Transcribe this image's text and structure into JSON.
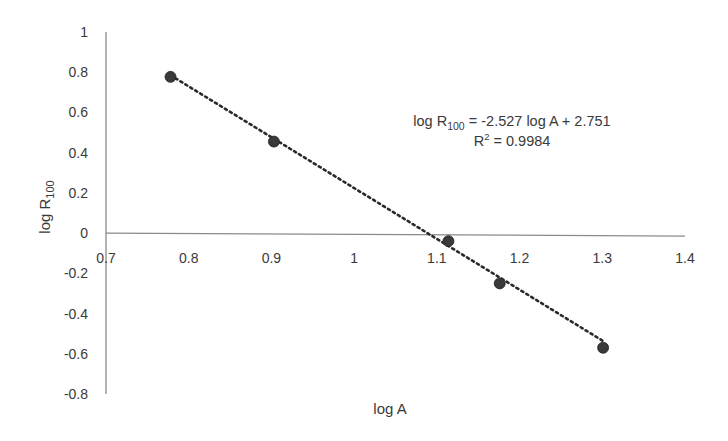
{
  "chart_data": {
    "type": "scatter",
    "title": "",
    "xlabel": "log A",
    "ylabel": "log R100",
    "ylabel_main": "log R",
    "ylabel_sub": "100",
    "xlim": [
      0.7,
      1.4
    ],
    "ylim": [
      -0.8,
      1.0
    ],
    "x_ticks": [
      "0.7",
      "0.8",
      "0.9",
      "1",
      "1.1",
      "1.2",
      "1.3",
      "1.4"
    ],
    "y_ticks": [
      "1",
      "0.8",
      "0.6",
      "0.4",
      "0.2",
      "0",
      "-0.2",
      "-0.4",
      "-0.6",
      "-0.8"
    ],
    "grid": false,
    "legend": null,
    "series": [
      {
        "name": "data",
        "marker": "circle",
        "color": "#3a3a3a",
        "points": [
          {
            "x": 0.778,
            "y": 0.777
          },
          {
            "x": 0.903,
            "y": 0.455
          },
          {
            "x": 1.114,
            "y": -0.04
          },
          {
            "x": 1.176,
            "y": -0.25
          },
          {
            "x": 1.301,
            "y": -0.57
          }
        ]
      }
    ],
    "trendline": {
      "type": "linear",
      "style": "dotted",
      "slope": -2.527,
      "intercept": 2.751,
      "x_range": [
        0.778,
        1.301
      ]
    },
    "annotations": {
      "equation_prefix": "log R",
      "equation_sub": "100",
      "equation_suffix": " = -2.527 log A + 2.751",
      "r2_prefix": "R",
      "r2_sup": "2",
      "r2_suffix": " = 0.9984"
    }
  }
}
